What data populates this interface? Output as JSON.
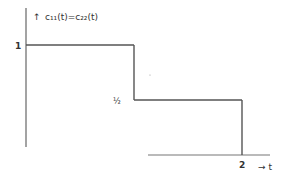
{
  "chart_data": {
    "type": "line",
    "title": "c₁₁(t)=c₂₂(t)",
    "ylabel_marker": "↑",
    "xlabel": "→ t",
    "x_ticks": [
      "2"
    ],
    "y_ticks": [
      "1",
      "½"
    ],
    "series": [
      {
        "name": "c11(t)=c22(t)",
        "style": "step",
        "x": [
          0,
          1,
          1,
          2,
          2,
          3
        ],
        "y": [
          1,
          1,
          0.5,
          0.5,
          0,
          0
        ]
      }
    ],
    "xlim": [
      0,
      3
    ],
    "ylim": [
      0,
      1
    ],
    "grid": false,
    "line_color": "#555555"
  }
}
